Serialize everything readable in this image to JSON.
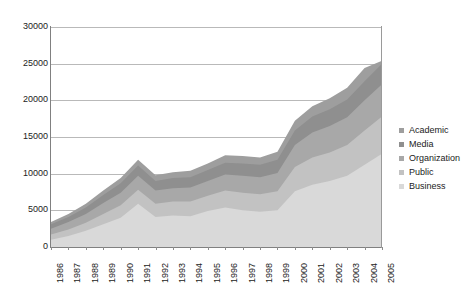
{
  "chart_data": {
    "type": "area",
    "stacked": true,
    "title": "",
    "xlabel": "",
    "ylabel": "",
    "ylim": [
      0,
      30000
    ],
    "ytick_labels": [
      "30000",
      "25000",
      "20000",
      "15000",
      "10000",
      "5000",
      "0"
    ],
    "ytick_values": [
      30000,
      25000,
      20000,
      15000,
      10000,
      5000,
      0
    ],
    "grid": true,
    "legend_position": "right",
    "categories": [
      "1986",
      "1987",
      "1988",
      "1989",
      "1990",
      "1991",
      "1992",
      "1993",
      "1994",
      "1995",
      "1996",
      "1997",
      "1998",
      "1999",
      "2000",
      "2001",
      "2002",
      "2003",
      "2004",
      "2005"
    ],
    "series": [
      {
        "name": "Business",
        "color": "#d9d9d9",
        "values": [
          1000,
          1500,
          2200,
          3100,
          4000,
          5900,
          4100,
          4300,
          4200,
          4900,
          5400,
          5000,
          4800,
          5000,
          7600,
          8500,
          9000,
          9700,
          11200,
          12700
        ]
      },
      {
        "name": "Public",
        "color": "#c2c2c2",
        "values": [
          700,
          900,
          1100,
          1400,
          1700,
          1900,
          1800,
          1900,
          2000,
          2100,
          2300,
          2400,
          2400,
          2600,
          3300,
          3700,
          3900,
          4200,
          4700,
          5100
        ]
      },
      {
        "name": "Organization",
        "color": "#a8a8a8",
        "values": [
          800,
          1000,
          1200,
          1500,
          1700,
          1900,
          1800,
          1800,
          1900,
          2000,
          2200,
          2300,
          2300,
          2500,
          3000,
          3400,
          3600,
          3800,
          4100,
          4400
        ]
      },
      {
        "name": "Media",
        "color": "#8f8f8f",
        "values": [
          600,
          700,
          900,
          1100,
          1300,
          1400,
          1300,
          1400,
          1400,
          1500,
          1600,
          1700,
          1700,
          1800,
          2000,
          2200,
          2300,
          2400,
          2600,
          2800
        ]
      },
      {
        "name": "Academic",
        "color": "#9e9e9e",
        "values": [
          300,
          400,
          500,
          600,
          700,
          800,
          800,
          800,
          900,
          900,
          1000,
          1000,
          1000,
          1100,
          1300,
          1400,
          1500,
          1600,
          1800,
          400
        ]
      }
    ],
    "totals": [
      3400,
      4500,
      5900,
      7700,
      9400,
      11900,
      9800,
      10200,
      10400,
      11400,
      12500,
      12400,
      12200,
      13000,
      17200,
      19200,
      20300,
      21700,
      24400,
      25400
    ]
  },
  "legend": {
    "items": [
      {
        "label": "Academic",
        "swatch": "#9e9e9e"
      },
      {
        "label": "Media",
        "swatch": "#8f8f8f"
      },
      {
        "label": "Organization",
        "swatch": "#a8a8a8"
      },
      {
        "label": "Public",
        "swatch": "#c2c2c2"
      },
      {
        "label": "Business",
        "swatch": "#d9d9d9"
      }
    ]
  }
}
